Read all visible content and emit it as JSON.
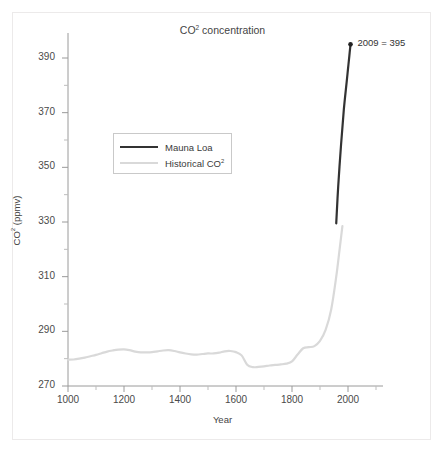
{
  "chart_data": {
    "type": "line",
    "title": "CO2 concentration",
    "title_display": "CO² concentration",
    "xlabel": "Year",
    "ylabel": "CO² (ppmv)",
    "xlim": [
      1000,
      2100
    ],
    "ylim": [
      270,
      396
    ],
    "grid": false,
    "legend_position": "upper-left-inside",
    "xticks": [
      1000,
      1200,
      1400,
      1600,
      1800,
      2000
    ],
    "xtick_labels": [
      "1000",
      "1200",
      "1400",
      "1600",
      "1800",
      "2000"
    ],
    "xminor_step": 100,
    "yticks": [
      270,
      290,
      310,
      330,
      350,
      370,
      390
    ],
    "ytick_labels": [
      "270",
      "290",
      "310",
      "330",
      "350",
      "370",
      "390"
    ],
    "yminor_step": 10,
    "annotations": [
      {
        "text": "2009 = 395",
        "x": 2009,
        "y": 395,
        "marker": "dot"
      }
    ],
    "series": [
      {
        "name": "Historical CO2",
        "name_display": "Historical CO²",
        "color": "#d9d9d9",
        "width": 2.2,
        "x": [
          1000,
          1020,
          1040,
          1060,
          1080,
          1100,
          1120,
          1140,
          1160,
          1180,
          1200,
          1220,
          1240,
          1260,
          1280,
          1300,
          1320,
          1340,
          1360,
          1380,
          1400,
          1420,
          1440,
          1460,
          1480,
          1500,
          1520,
          1540,
          1560,
          1580,
          1600,
          1620,
          1640,
          1660,
          1680,
          1700,
          1720,
          1740,
          1760,
          1780,
          1800,
          1820,
          1840,
          1860,
          1880,
          1900,
          1920,
          1940,
          1958,
          1970,
          1980
        ],
        "y": [
          279.6,
          279.7,
          280.0,
          280.4,
          280.9,
          281.4,
          282.0,
          282.6,
          283.0,
          283.3,
          283.4,
          283.1,
          282.6,
          282.3,
          282.3,
          282.4,
          282.7,
          283.0,
          283.1,
          282.8,
          282.3,
          281.9,
          281.6,
          281.5,
          281.7,
          281.9,
          281.9,
          282.2,
          282.7,
          282.8,
          282.4,
          281.2,
          277.8,
          276.9,
          277.0,
          277.2,
          277.5,
          277.7,
          277.9,
          278.2,
          279.0,
          281.5,
          283.8,
          284.2,
          284.6,
          286.5,
          290.5,
          298.0,
          310.0,
          320.0,
          328.5
        ]
      },
      {
        "name": "Mauna Loa",
        "name_display": "Mauna Loa",
        "color": "#333333",
        "width": 2.2,
        "x": [
          1958,
          1965,
          1975,
          1985,
          1995,
          2000,
          2005,
          2009
        ],
        "y": [
          329.5,
          343.0,
          358.0,
          371.0,
          381.0,
          386.0,
          391.0,
          395.0
        ]
      }
    ]
  },
  "legend": {
    "items": [
      {
        "label": "Mauna Loa",
        "color": "#333333"
      },
      {
        "label": "Historical CO²",
        "color": "#d9d9d9"
      }
    ]
  }
}
